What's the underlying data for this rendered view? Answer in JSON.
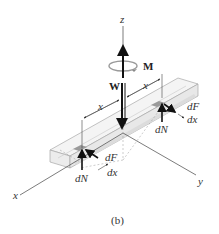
{
  "figure": {
    "caption": "(b)",
    "labels": {
      "z_axis": "z",
      "x_axis": "x",
      "y_axis": "y",
      "moment": "M",
      "weight": "W",
      "dim_x_left": "x",
      "dim_x_right": "x",
      "dF_right": "dF",
      "dx_right": "dx",
      "dN_right": "dN",
      "dF_left": "dF",
      "dx_left": "dx",
      "dN_left": "dN"
    },
    "colors": {
      "line": "#333333",
      "bar_fill": "#f2f2f2",
      "bar_edge": "#a8a8a8",
      "contact_patch": "#9a9a9a",
      "moment_ring": "#9a9a9a"
    }
  }
}
